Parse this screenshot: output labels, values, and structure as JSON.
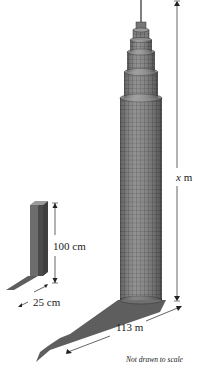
{
  "diagram": {
    "labels": {
      "tower_height": "x",
      "tower_height_unit": "m",
      "post_height": "100 cm",
      "post_shadow": "25 cm",
      "tower_shadow": "113 m",
      "note": "Not drawn to scale"
    },
    "colors": {
      "building_fill": "#7a7a7a",
      "building_grid": "#3a3a3a",
      "shadow": "#5a5a5a",
      "post_front": "#6d6d6d",
      "post_side": "#4a4a4a",
      "line": "#222222"
    }
  }
}
